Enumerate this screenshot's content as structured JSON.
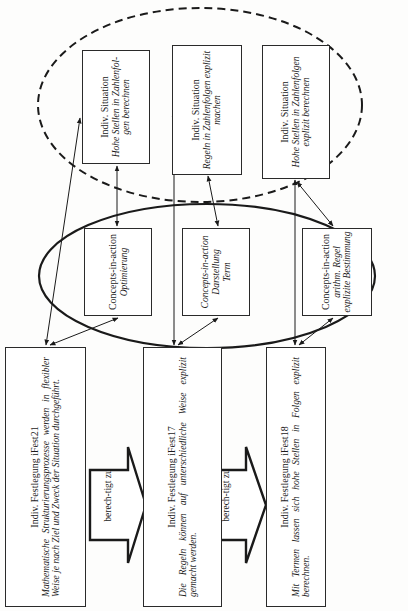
{
  "diagram": {
    "orientation": "rotated-90-ccw",
    "situations": [
      {
        "id": "situation-1",
        "title": "Indiv. Situation",
        "body": "Hohe Stellen in Zahlenfol-gen berechnen"
      },
      {
        "id": "situation-2",
        "title": "Indiv. Situation",
        "body": "Regeln in Zahlenfolgen explizit machen"
      },
      {
        "id": "situation-3",
        "title": "Indiv. Situation",
        "body": "Hohe Stellen in Zahlenfolgen explizit berechnen"
      }
    ],
    "concepts_in_action": [
      {
        "id": "cia-1",
        "title": "Concepts-in-action",
        "body": "Optimierung"
      },
      {
        "id": "cia-2",
        "title": "Concepts-in-action",
        "body": "Darstellung Term"
      },
      {
        "id": "cia-3",
        "title": "Concepts-in-action",
        "body": "arithm. Regel explizite Bestimmung"
      }
    ],
    "festlegungen": [
      {
        "id": "ifest21",
        "title": "Indiv. Festlegung iFest21",
        "body": "Mathematische Strukturierungsprozesse werden in flexibler Weise je nach Ziel und Zweck der Situation durchgeführt."
      },
      {
        "id": "ifest17",
        "title": "Indiv. Festlegung iFest17",
        "body": "Die Regeln können auf unterschiedliche Weise explizit gemacht werden."
      },
      {
        "id": "ifest18",
        "title": "Indiv. Festlegung iFest18",
        "body": "Mit Termen lassen sich hohe Stellen in Folgen explizit berechnen."
      }
    ],
    "entitlement_arrows": [
      {
        "id": "arrow-1",
        "label": "berech-tigt zu"
      },
      {
        "id": "arrow-2",
        "label": "berech-tigt zu"
      }
    ],
    "groups": {
      "situations_ellipse": "dashed",
      "concepts_ellipse": "solid"
    },
    "colors": {
      "line": "#1a1a1a",
      "box_border": "#2a2a2a",
      "background": "#fdfdfc"
    }
  }
}
